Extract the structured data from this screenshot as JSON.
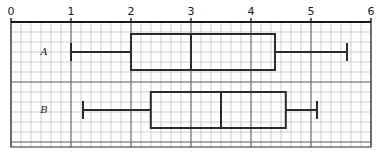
{
  "figure": {
    "width": 379,
    "height": 156,
    "background": "#ffffff",
    "ink_color": "#2b2b2b",
    "grid_minor_color": "#b9b9b9",
    "grid_major_color": "#6e6e6e"
  },
  "axis": {
    "orientation": "horizontal",
    "position": "top",
    "min": 0,
    "max": 6,
    "tick_step": 1,
    "tick_labels": [
      "0",
      "1",
      "2",
      "3",
      "4",
      "5",
      "6"
    ],
    "tick_values": [
      0,
      1,
      2,
      3,
      4,
      5,
      6
    ],
    "pixels_per_unit": 60,
    "origin_px": 11
  },
  "grid": {
    "visible": true,
    "minor_cell_px": 10,
    "minor_per_major": 6,
    "top_px": 22,
    "bottom_px": 147,
    "left_px": 11,
    "right_px": 371
  },
  "chart_data": {
    "type": "box",
    "title": "",
    "xlabel": "",
    "ylabel": "",
    "xlim": [
      0,
      6
    ],
    "grid": true,
    "legend": "none",
    "orientation": "horizontal",
    "categories": [
      "A",
      "B"
    ],
    "boxes": [
      {
        "label": "A",
        "whisker_low": 1.0,
        "q1": 2.0,
        "median": 3.0,
        "q3": 4.4,
        "whisker_high": 5.6,
        "iqr": 2.4,
        "range": 4.6,
        "center_y_px": 52,
        "box_half_height_px": 18,
        "label_x_px": 44,
        "label_y_px": 55
      },
      {
        "label": "B",
        "whisker_low": 1.2,
        "q1": 2.33,
        "median": 3.5,
        "q3": 4.58,
        "whisker_high": 5.1,
        "iqr": 2.25,
        "range": 3.9,
        "center_y_px": 110,
        "box_half_height_px": 18,
        "label_x_px": 44,
        "label_y_px": 113
      }
    ]
  }
}
